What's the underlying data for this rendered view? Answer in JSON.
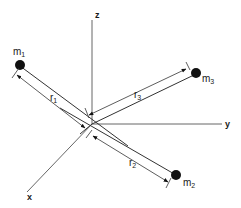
{
  "figure": {
    "axes": {
      "x_label": "x",
      "y_label": "y",
      "z_label": "z"
    },
    "masses": [
      {
        "id": "m1",
        "label": "m",
        "subscript": "1"
      },
      {
        "id": "m2",
        "label": "m",
        "subscript": "2"
      },
      {
        "id": "m3",
        "label": "m",
        "subscript": "3"
      }
    ],
    "distances": [
      {
        "id": "r1",
        "label": "r",
        "subscript": "1"
      },
      {
        "id": "r2",
        "label": "r",
        "subscript": "2"
      },
      {
        "id": "r3",
        "label": "r",
        "subscript": "3"
      }
    ],
    "colors": {
      "line": "#333333",
      "axis": "#555555",
      "mass": "#111111",
      "background": "#ffffff"
    }
  }
}
